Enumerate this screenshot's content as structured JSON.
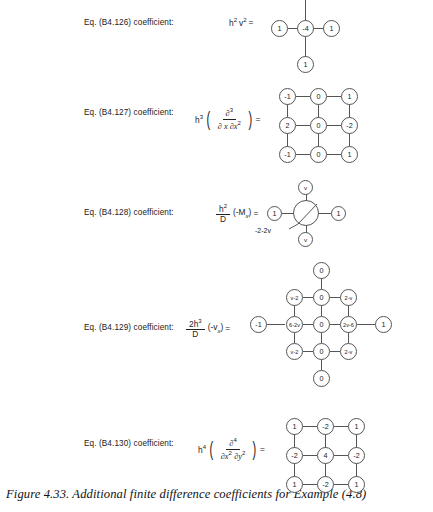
{
  "figure": {
    "caption": "Figure 4.33.  Additional finite difference coefficients for Example (4.8)"
  },
  "equations": [
    {
      "id": "b4-126",
      "label": "Eq. (B4.126) coefficient:",
      "expression_text": "h2v2 =",
      "expr": {
        "h": "h",
        "h_sup": "2",
        "v": "v",
        "v_sup": "2",
        "eq": "="
      },
      "stencil": {
        "type": "plus",
        "values": {
          "top": "1",
          "left": "1",
          "center": "-4",
          "right": "1",
          "bottom": "1"
        }
      }
    },
    {
      "id": "b4-127",
      "label": "Eq. (B4.127) coefficient:",
      "expression_text": "h3 ( ∂3 / ∂x ∂x2 ) =",
      "expr": {
        "h": "h",
        "h_sup": "3",
        "num": "∂",
        "num_sup": "3",
        "den": "∂ x ∂x",
        "den_sup": "2",
        "eq": "="
      },
      "stencil": {
        "type": "grid3x3",
        "rows": [
          [
            "-1",
            "0",
            "1"
          ],
          [
            "2",
            "0",
            "-2"
          ],
          [
            "-1",
            "0",
            "1"
          ]
        ]
      }
    },
    {
      "id": "b4-128",
      "label": "Eq. (B4.128) coefficient:",
      "expression_text": "h2/D (-Mx) =",
      "expr": {
        "num": "h",
        "num_sup": "2",
        "den": "D",
        "paren_open": "(",
        "minus_m": "-M",
        "m_sub": "x",
        "paren_close": ")",
        "eq": "="
      },
      "stencil": {
        "type": "plus-annotated",
        "values": {
          "top": "v",
          "left": "1",
          "center": "",
          "right": "1",
          "bottom": "v"
        },
        "annotation": "-2-2v"
      }
    },
    {
      "id": "b4-129",
      "label": "Eq. (B4.129) coefficient:",
      "expression_text": "2h3/D (-vx) =",
      "expr": {
        "num": "2h",
        "num_sup": "3",
        "den": "D",
        "paren_open": "(",
        "minus_v": "-v",
        "v_sub": "x",
        "paren_close": ")",
        "eq": "="
      },
      "stencil": {
        "type": "cross5",
        "values": {
          "top": "0",
          "r1": [
            "v-2",
            "0",
            "2-v"
          ],
          "far_left": "-1",
          "r2": [
            "6-2v",
            "0",
            "2v-6"
          ],
          "far_right": "1",
          "r3": [
            "v-2",
            "0",
            "2-v"
          ],
          "bottom": "0"
        }
      }
    },
    {
      "id": "b4-130",
      "label": "Eq. (B4.130) coefficient:",
      "expression_text": "h4 ( ∂4 / ∂x2 ∂y2 ) =",
      "expr": {
        "h": "h",
        "h_sup": "4",
        "num": "∂",
        "num_sup": "4",
        "den_a": "∂x",
        "den_a_sup": "2",
        "den_b": "∂y",
        "den_b_sup": "2",
        "eq": "="
      },
      "stencil": {
        "type": "grid3x3",
        "rows": [
          [
            "1",
            "-2",
            "1"
          ],
          [
            "-2",
            "4",
            "-2"
          ],
          [
            "1",
            "-2",
            "1"
          ]
        ]
      }
    }
  ],
  "colors": {
    "background": "#ffffff",
    "ink": "#1a1a1a",
    "stroke": "#555555"
  }
}
